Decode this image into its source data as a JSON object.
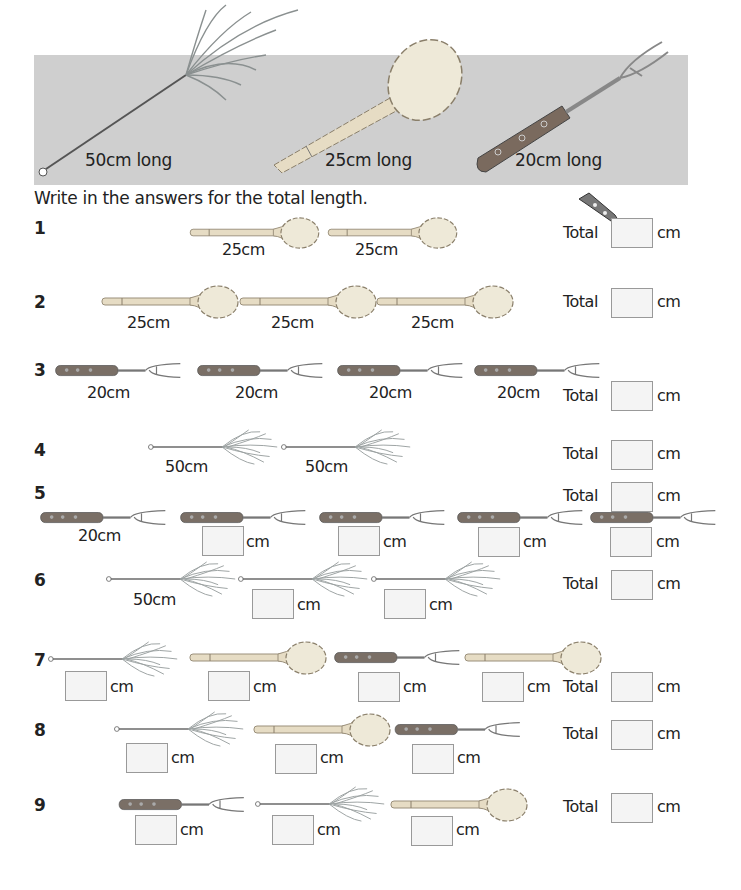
{
  "banner": {
    "items": [
      {
        "name": "feather-duster",
        "label": "50cm long"
      },
      {
        "name": "wooden-spoon",
        "label": "25cm long"
      },
      {
        "name": "fork",
        "label": "20cm long"
      }
    ]
  },
  "instruction": "Write in the answers for the total length.",
  "unit": "cm",
  "total_label": "Total",
  "questions": [
    {
      "num": "1",
      "items": [
        {
          "type": "spoon",
          "label": "25cm"
        },
        {
          "type": "spoon",
          "label": "25cm"
        }
      ],
      "total": ""
    },
    {
      "num": "2",
      "items": [
        {
          "type": "spoon",
          "label": "25cm"
        },
        {
          "type": "spoon",
          "label": "25cm"
        },
        {
          "type": "spoon",
          "label": "25cm"
        }
      ],
      "total": ""
    },
    {
      "num": "3",
      "items": [
        {
          "type": "fork",
          "label": "20cm"
        },
        {
          "type": "fork",
          "label": "20cm"
        },
        {
          "type": "fork",
          "label": "20cm"
        },
        {
          "type": "fork",
          "label": "20cm"
        }
      ],
      "total": ""
    },
    {
      "num": "4",
      "items": [
        {
          "type": "duster",
          "label": "50cm"
        },
        {
          "type": "duster",
          "label": "50cm"
        }
      ],
      "total": ""
    },
    {
      "num": "5",
      "items": [
        {
          "type": "fork",
          "label": "20cm"
        },
        {
          "type": "fork",
          "label": ""
        },
        {
          "type": "fork",
          "label": ""
        },
        {
          "type": "fork",
          "label": ""
        },
        {
          "type": "fork",
          "label": ""
        }
      ],
      "total": ""
    },
    {
      "num": "6",
      "items": [
        {
          "type": "duster",
          "label": "50cm"
        },
        {
          "type": "duster",
          "label": ""
        },
        {
          "type": "duster",
          "label": ""
        }
      ],
      "total": ""
    },
    {
      "num": "7",
      "items": [
        {
          "type": "duster",
          "label": ""
        },
        {
          "type": "spoon",
          "label": ""
        },
        {
          "type": "fork",
          "label": ""
        },
        {
          "type": "spoon",
          "label": ""
        }
      ],
      "total": ""
    },
    {
      "num": "8",
      "items": [
        {
          "type": "duster",
          "label": ""
        },
        {
          "type": "spoon",
          "label": ""
        },
        {
          "type": "fork",
          "label": ""
        }
      ],
      "total": ""
    },
    {
      "num": "9",
      "items": [
        {
          "type": "fork",
          "label": ""
        },
        {
          "type": "duster",
          "label": ""
        },
        {
          "type": "spoon",
          "label": ""
        }
      ],
      "total": ""
    }
  ],
  "decor": {
    "pencil": "pencil-icon"
  }
}
